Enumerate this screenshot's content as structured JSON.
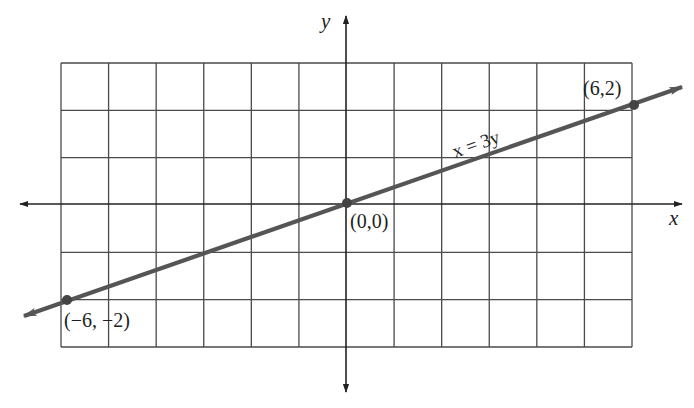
{
  "chart_data": {
    "type": "line",
    "title": "",
    "xlabel": "x",
    "ylabel": "y",
    "xlim": [
      -6,
      6
    ],
    "ylim": [
      -3,
      3
    ],
    "grid": true,
    "grid_step": 1,
    "legend": null,
    "series": [
      {
        "name": "x = 3y",
        "equation": "x = 3y",
        "x": [
          -6,
          0,
          6
        ],
        "y": [
          -2,
          0,
          2
        ],
        "extends_with_arrows": true
      }
    ],
    "points": [
      {
        "label": "(−6, −2)",
        "x": -6,
        "y": -2
      },
      {
        "label": "(0,0)",
        "x": 0,
        "y": 0
      },
      {
        "label": "(6,2)",
        "x": 6,
        "y": 2
      }
    ],
    "annotations": [
      {
        "text": "x = 3y",
        "near": [
          2.5,
          1
        ],
        "rotated_along_line": true
      }
    ]
  },
  "labels": {
    "x_axis": "x",
    "y_axis": "y",
    "equation": "x = 3y",
    "point_neg": "(−6, −2)",
    "point_origin": "(0,0)",
    "point_pos": "(6,2)"
  },
  "colors": {
    "grid": "#4a4a4a",
    "axis": "#222222",
    "line": "#555555",
    "point": "#444444",
    "text": "#1e1e1e"
  }
}
